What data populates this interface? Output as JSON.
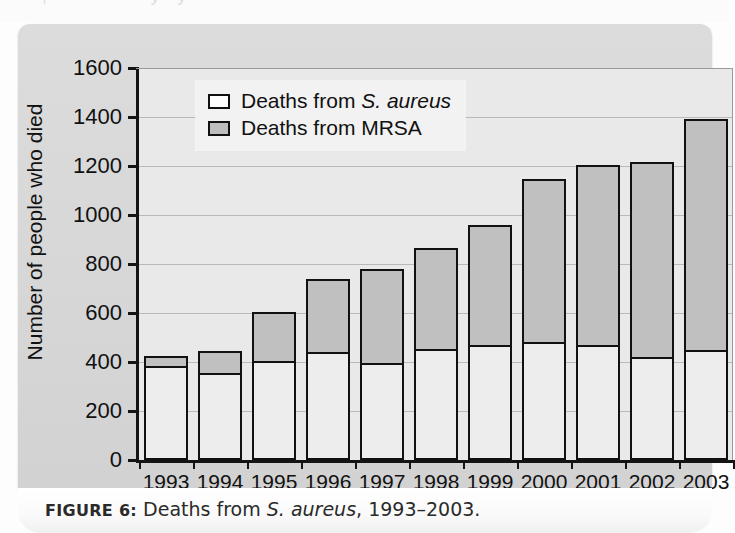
{
  "figure": {
    "caption_label": "FIGURE 6:",
    "caption_text_before": " Deaths from ",
    "caption_italic": "S. aureus",
    "caption_text_after": ", 1993–2003."
  },
  "legend": {
    "position": "top-left",
    "items": [
      {
        "swatch": "white",
        "text_before": "Deaths from ",
        "italic": "S. aureus",
        "text_after": ""
      },
      {
        "swatch": "gray",
        "text_before": "Deaths from MRSA",
        "italic": "",
        "text_after": ""
      }
    ]
  },
  "axes": {
    "y_title": "Number of people who died",
    "x_title": "Year",
    "y_ticks": [
      "0",
      "200",
      "400",
      "600",
      "800",
      "1000",
      "1200",
      "1400",
      "1600"
    ]
  },
  "colors": {
    "panel_background": "#d8d8d8",
    "plot_background": "#e9e9e9",
    "bar_outline": "#111111",
    "s_aureus_fill": "#ededed",
    "mrsa_fill": "#c0c0c0",
    "gridline": "#b9b9b9",
    "caption_background": "#ffffff"
  },
  "chart_data": {
    "type": "bar",
    "variant": "stacked",
    "xlabel": "Year",
    "ylabel": "Number of people who died",
    "ylim": [
      0,
      1600
    ],
    "ytick_step": 200,
    "grid": true,
    "legend_position": "top-left",
    "categories": [
      "1993",
      "1994",
      "1995",
      "1996",
      "1997",
      "1998",
      "1999",
      "2000",
      "2001",
      "2002",
      "2003"
    ],
    "series": [
      {
        "name": "Deaths from S. aureus",
        "fill": "#ededed",
        "values": [
          385,
          355,
          405,
          440,
          395,
          455,
          470,
          480,
          468,
          422,
          448
        ]
      },
      {
        "name": "Deaths from MRSA",
        "fill": "#c0c0c0",
        "values": [
          40,
          90,
          200,
          300,
          385,
          410,
          490,
          665,
          735,
          795,
          945
        ]
      }
    ],
    "totals": [
      425,
      445,
      605,
      740,
      780,
      865,
      960,
      1145,
      1203,
      1217,
      1393
    ]
  }
}
